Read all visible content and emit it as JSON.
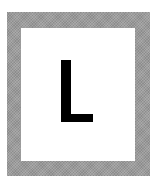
{
  "card": {
    "letter": "L",
    "frame_color": "#9c9c9c",
    "background_color": "#ffffff",
    "letter_color": "#000000"
  }
}
